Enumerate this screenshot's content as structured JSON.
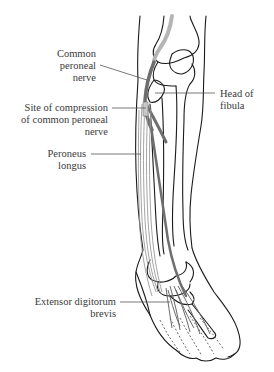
{
  "figure": {
    "colors": {
      "outline": "#1a1a1a",
      "nerve": "#6e6e6e",
      "nerve_proximal": "#b5b5b5",
      "muscle": "#9a9a9a",
      "leader": "#555555",
      "label_text": "#3a3a3a"
    }
  },
  "labels": [
    {
      "id": "common-peroneal-nerve",
      "lines": [
        "Common",
        "peroneal",
        "nerve"
      ]
    },
    {
      "id": "head-of-fibula",
      "lines": [
        "Head of",
        "fibula"
      ]
    },
    {
      "id": "site-of-compression",
      "lines": [
        "Site of compression",
        "of common peroneal",
        "nerve"
      ]
    },
    {
      "id": "peroneus-longus",
      "lines": [
        "Peroneus",
        "longus"
      ]
    },
    {
      "id": "extensor-digitorum-brevis",
      "lines": [
        "Extensor digitorum",
        "brevis"
      ]
    }
  ]
}
